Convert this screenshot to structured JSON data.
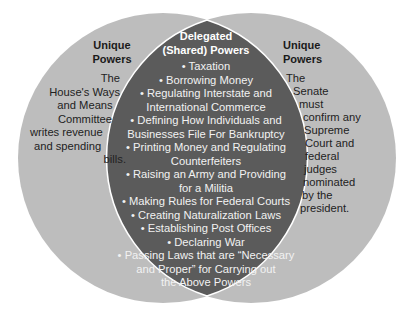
{
  "colors": {
    "outer_circle": "#bdbdbd",
    "overlap": "#5b5b5b",
    "overlap_outline": "#ffffff",
    "outer_text": "#222222",
    "overlap_text": "#f2f2f2"
  },
  "left": {
    "title_line1": "Unique",
    "title_line2": "Powers",
    "body_lines": [
      "The",
      "House's Ways",
      "and Means",
      "Committee",
      "writes revenue",
      "and spending",
      "bills."
    ]
  },
  "right": {
    "title_line1": "Unique",
    "title_line2": "Powers",
    "body_lines": [
      "The",
      "Senate",
      "must",
      "confirm any",
      "Supreme",
      "Court and",
      "federal",
      "judges",
      "nominated",
      "by the",
      "president."
    ]
  },
  "center": {
    "title_line1": "Delegated",
    "title_line2": "(Shared) Powers",
    "item_lines": [
      "• Taxation",
      "• Borrowing Money",
      "• Regulating Interstate and",
      "International Commerce",
      "• Defining How Individuals and",
      "Businesses File For Bankruptcy",
      "• Printing Money and Regulating",
      "Counterfeiters",
      "• Raising an Army and Providing",
      "for a Militia",
      "• Making Rules for Federal Courts",
      "• Creating Naturalization Laws",
      "• Establishing Post Offices",
      "• Declaring War",
      "• Passing Laws that are “Necessary",
      "and Proper” for Carrying out",
      "the Above Powers"
    ]
  }
}
